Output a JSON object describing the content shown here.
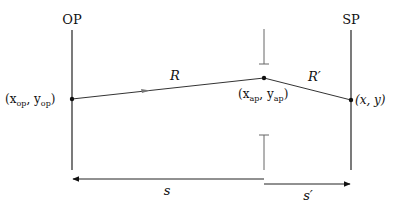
{
  "diagram": {
    "planes": {
      "object_plane": {
        "label": "OP",
        "x": 72
      },
      "source_plane": {
        "label": "SP",
        "x": 351
      }
    },
    "aperture": {
      "x": 264
    },
    "points": {
      "op_point": {
        "label_main": "(x",
        "sub1": "op",
        "mid": ", y",
        "sub2": "op",
        "end": ")"
      },
      "ap_point": {
        "label_main": "(x",
        "sub1": "ap",
        "mid": ", y",
        "sub2": "ap",
        "end": ")"
      },
      "sp_point": {
        "label": "(x, y)"
      }
    },
    "segments": {
      "R": {
        "label": "R"
      },
      "R_prime": {
        "label": "R′"
      }
    },
    "distances": {
      "s": {
        "label": "s"
      },
      "s_prime": {
        "label": "s′"
      }
    },
    "colors": {
      "line": "#111111",
      "aperture": "#555555",
      "arrow": "#777777"
    }
  }
}
